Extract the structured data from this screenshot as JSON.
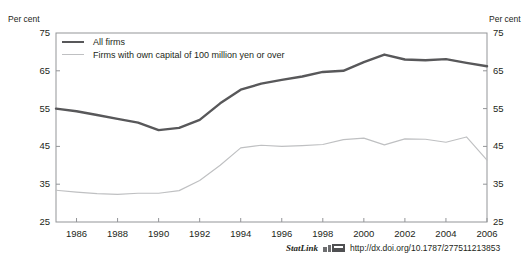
{
  "figure": {
    "title_fragment": "",
    "axis_unit_left": "Per cent",
    "axis_unit_right": "Per cent"
  },
  "legend": {
    "entries": [
      {
        "label": "All firms",
        "color": "#58585a"
      },
      {
        "label": "Firms with own capital of 100 million yen or over",
        "color": "#bfc0c2"
      }
    ]
  },
  "footer": {
    "statlink_label": "StatLink",
    "url": "http://dx.doi.org/10.1787/277511213853"
  },
  "chart_data": {
    "type": "line",
    "title": "",
    "xlabel": "",
    "ylabel": "Per cent",
    "ylim": [
      25,
      75
    ],
    "yticks": [
      25,
      35,
      45,
      55,
      65,
      75
    ],
    "xlim": [
      1985,
      2006
    ],
    "xticks": [
      1986,
      1988,
      1990,
      1992,
      1994,
      1996,
      1998,
      2000,
      2002,
      2004,
      2006
    ],
    "grid": false,
    "legend_position": "top-left",
    "x": [
      1985,
      1986,
      1987,
      1988,
      1989,
      1990,
      1991,
      1992,
      1993,
      1994,
      1995,
      1996,
      1997,
      1998,
      1999,
      2000,
      2001,
      2002,
      2003,
      2004,
      2005,
      2006
    ],
    "series": [
      {
        "name": "All firms",
        "color": "#58585a",
        "values": [
          55.0,
          54.3,
          53.3,
          52.3,
          51.3,
          49.3,
          49.9,
          52.0,
          56.4,
          60.0,
          61.6,
          62.6,
          63.5,
          64.7,
          65.0,
          67.3,
          69.3,
          68.0,
          67.8,
          68.1,
          67.1,
          66.2
        ]
      },
      {
        "name": "Firms with own capital of 100 million yen or over",
        "color": "#bfc0c2",
        "values": [
          33.4,
          32.9,
          32.5,
          32.3,
          32.6,
          32.6,
          33.3,
          36.0,
          40.0,
          44.6,
          45.3,
          45.0,
          45.2,
          45.5,
          46.8,
          47.2,
          45.4,
          47.0,
          46.9,
          46.1,
          47.5,
          41.4
        ]
      }
    ]
  }
}
